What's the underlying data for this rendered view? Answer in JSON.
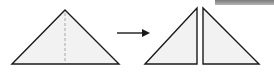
{
  "diagram": {
    "type": "fold-and-cut instruction step",
    "description": "A triangle with a dashed center fold line, an arrow, and the result: two right triangles",
    "colors": {
      "fill": "#f2f2f2",
      "stroke": "#1a1a1a",
      "dash": "#b8b8b8",
      "header_bar": "#8c8c8c"
    },
    "source_shape": {
      "name": "isosceles triangle",
      "points": [
        [
          12,
          64
        ],
        [
          65,
          10
        ],
        [
          119,
          64
        ]
      ],
      "fold_line": {
        "x": 65,
        "y1": 10,
        "y2": 64,
        "style": "dashed"
      }
    },
    "arrow": {
      "x1": 117,
      "y1": 33,
      "x2": 150,
      "y2": 33,
      "direction": "right"
    },
    "result_shapes": [
      {
        "name": "left right-triangle",
        "points": [
          [
            145,
            64
          ],
          [
            197,
            8
          ],
          [
            197,
            64
          ]
        ]
      },
      {
        "name": "right right-triangle",
        "points": [
          [
            203,
            8
          ],
          [
            203,
            64
          ],
          [
            259,
            64
          ]
        ]
      }
    ],
    "header_bar": {
      "x": 215,
      "y": 0,
      "width": 59,
      "height": 5
    }
  }
}
